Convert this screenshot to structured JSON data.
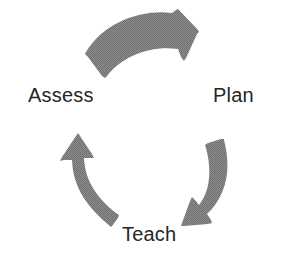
{
  "diagram": {
    "type": "cyclical-process",
    "title": "",
    "direction": "clockwise",
    "background_color": "#ffffff",
    "arrow_color": "#8a8a8a",
    "arrow_texture": "halftone-dither",
    "label_color": "#262626",
    "stages": [
      {
        "id": "plan",
        "label": "Plan",
        "position": "right",
        "order": 1
      },
      {
        "id": "teach",
        "label": "Teach",
        "position": "bottom",
        "order": 2
      },
      {
        "id": "assess",
        "label": "Assess",
        "position": "left",
        "order": 3
      }
    ],
    "arrows": [
      {
        "id": "arrow-assess-to-plan",
        "from": "assess",
        "to": "plan",
        "position": "top",
        "points": "right"
      },
      {
        "id": "arrow-plan-to-teach",
        "from": "plan",
        "to": "teach",
        "position": "right",
        "points": "down-left"
      },
      {
        "id": "arrow-teach-to-assess",
        "from": "teach",
        "to": "assess",
        "position": "left",
        "points": "up"
      }
    ]
  }
}
